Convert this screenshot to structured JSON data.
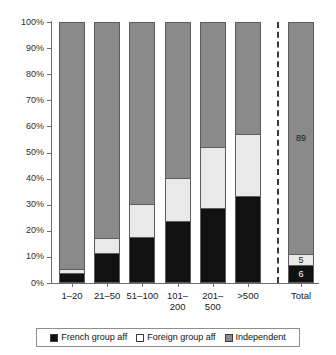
{
  "chart_data": {
    "type": "bar",
    "subtype": "stacked-percentage",
    "title": "",
    "xlabel": "",
    "ylabel": "",
    "ylim": [
      0,
      100
    ],
    "grid": false,
    "legend_position": "bottom",
    "categories": [
      "1–20",
      "21–50",
      "51–100",
      "101–\n200",
      "201–\n500",
      ">500",
      "Total"
    ],
    "series": [
      {
        "name": "French group aff",
        "color": "#111111",
        "values": [
          3,
          11,
          17,
          23,
          28,
          33,
          6
        ]
      },
      {
        "name": "Foreign group aff",
        "color": "#e9e9e9",
        "values": [
          2,
          6,
          13,
          17,
          24,
          24,
          5
        ]
      },
      {
        "name": "Independent",
        "color": "#8a8a8a",
        "values": [
          95,
          83,
          70,
          60,
          48,
          43,
          89
        ]
      }
    ],
    "y_ticks": [
      "0%",
      "10%",
      "20%",
      "30%",
      "40%",
      "50%",
      "60%",
      "70%",
      "80%",
      "90%",
      "100%"
    ],
    "y_tick_values": [
      0,
      10,
      20,
      30,
      40,
      50,
      60,
      70,
      80,
      90,
      100
    ],
    "data_labels": {
      "Total": {
        "french": "6",
        "foreign": "5",
        "independent": "89"
      }
    },
    "annotations": [
      {
        "type": "vertical-dashed-separator",
        "before_category": "Total"
      }
    ]
  },
  "axis": {
    "y_ticks": [
      {
        "label": "100%",
        "value": 100
      },
      {
        "label": "90%",
        "value": 90
      },
      {
        "label": "80%",
        "value": 80
      },
      {
        "label": "70%",
        "value": 70
      },
      {
        "label": "60%",
        "value": 60
      },
      {
        "label": "50%",
        "value": 50
      },
      {
        "label": "40%",
        "value": 40
      },
      {
        "label": "30%",
        "value": 30
      },
      {
        "label": "20%",
        "value": 20
      },
      {
        "label": "10%",
        "value": 10
      },
      {
        "label": "0%",
        "value": 0
      }
    ]
  },
  "bars": [
    {
      "id": "bar-1-20",
      "label_line1": "1–20",
      "label_line2": "",
      "french": 3,
      "foreign": 2,
      "independent": 95,
      "french_label": "",
      "foreign_label": "",
      "independent_label": ""
    },
    {
      "id": "bar-21-50",
      "label_line1": "21–50",
      "label_line2": "",
      "french": 11,
      "foreign": 6,
      "independent": 83,
      "french_label": "",
      "foreign_label": "",
      "independent_label": ""
    },
    {
      "id": "bar-51-100",
      "label_line1": "51–100",
      "label_line2": "",
      "french": 17,
      "foreign": 13,
      "independent": 70,
      "french_label": "",
      "foreign_label": "",
      "independent_label": ""
    },
    {
      "id": "bar-101-200",
      "label_line1": "101–",
      "label_line2": "200",
      "french": 23,
      "foreign": 17,
      "independent": 60,
      "french_label": "",
      "foreign_label": "",
      "independent_label": ""
    },
    {
      "id": "bar-201-500",
      "label_line1": "201–",
      "label_line2": "500",
      "french": 28,
      "foreign": 24,
      "independent": 48,
      "french_label": "",
      "foreign_label": "",
      "independent_label": ""
    },
    {
      "id": "bar-over-500",
      "label_line1": ">500",
      "label_line2": "",
      "french": 33,
      "foreign": 24,
      "independent": 43,
      "french_label": "",
      "foreign_label": "",
      "independent_label": ""
    },
    {
      "id": "bar-total",
      "label_line1": "Total",
      "label_line2": "",
      "french": 6,
      "foreign": 5,
      "independent": 89,
      "french_label": "6",
      "foreign_label": "5",
      "independent_label": "89"
    }
  ],
  "legend": {
    "items": [
      {
        "label": "French group aff",
        "swatch": "sw-french",
        "color": "#111111"
      },
      {
        "label": "Foreign group aff",
        "swatch": "sw-foreign",
        "color": "#ffffff"
      },
      {
        "label": "Independent",
        "swatch": "sw-independent",
        "color": "#8a8a8a"
      }
    ]
  },
  "colors": {
    "french": "#111111",
    "foreign": "#e9e9e9",
    "independent": "#8a8a8a",
    "axis": "#6d6d6d",
    "separator": "#3a3a3a"
  }
}
